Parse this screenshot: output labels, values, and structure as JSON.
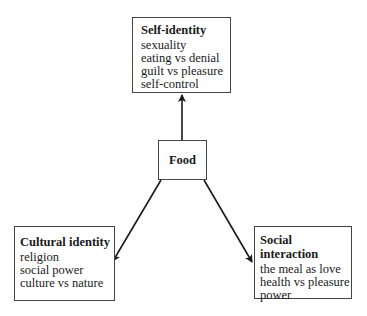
{
  "diagram": {
    "center": {
      "label": "Food"
    },
    "nodes": [
      {
        "id": "self",
        "title": "Self-identity",
        "items": [
          "sexuality",
          "eating vs denial",
          "guilt vs pleasure",
          "self-control"
        ]
      },
      {
        "id": "cultural",
        "title": "Cultural identity",
        "items": [
          "religion",
          "social power",
          "culture vs nature"
        ]
      },
      {
        "id": "social",
        "title": "Social interaction",
        "items": [
          "the meal as love",
          "health vs pleasure",
          "power"
        ]
      }
    ],
    "edges": [
      {
        "from": "Food",
        "to": "Self-identity"
      },
      {
        "from": "Food",
        "to": "Cultural identity"
      },
      {
        "from": "Food",
        "to": "Social interaction"
      }
    ]
  }
}
